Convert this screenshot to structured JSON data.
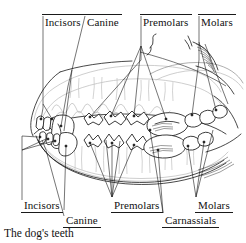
{
  "figure": {
    "caption": "The dog's teeth",
    "ink_color": "#1a1a1a",
    "background_color": "#ffffff"
  },
  "labels_top": [
    {
      "id": "incisors-top",
      "text": "Incisors"
    },
    {
      "id": "canine-top",
      "text": "Canine"
    },
    {
      "id": "premolars-top",
      "text": "Premolars"
    },
    {
      "id": "molars-top",
      "text": "Molars"
    }
  ],
  "labels_bottom": [
    {
      "id": "incisors-bottom",
      "text": "Incisors"
    },
    {
      "id": "canine-bottom",
      "text": "Canine"
    },
    {
      "id": "premolars-bottom",
      "text": "Premolars"
    },
    {
      "id": "carnassials-bottom",
      "text": "Carnassials"
    },
    {
      "id": "molars-bottom",
      "text": "Molars"
    }
  ]
}
